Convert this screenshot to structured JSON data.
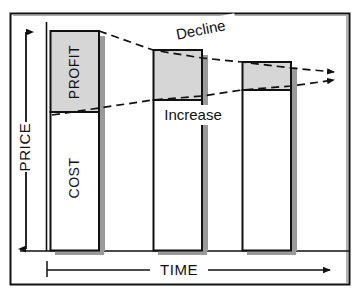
{
  "figure": {
    "type": "diagram",
    "axes": {
      "y_label": "PRICE",
      "x_label": "TIME",
      "y_arrow": "double-headed-vertical",
      "x_arrow": "single-right"
    },
    "segment_labels": {
      "profit": "PROFIT",
      "cost": "COST"
    },
    "trend_labels": {
      "decline": "Decline",
      "increase": "Increase"
    },
    "colors": {
      "profit_fill": "#d6d6d6",
      "cost_fill": "#ffffff",
      "outline": "#111111",
      "shadow": "#9a9a9a",
      "frame": "#111111",
      "background": "#ffffff"
    },
    "bars": [
      {
        "name": "bar-1",
        "x": 50,
        "width": 49,
        "top": 31,
        "baseline": 250,
        "profit_bottom": 112,
        "profit_label": "PROFIT",
        "cost_label": "COST"
      },
      {
        "name": "bar-2",
        "x": 153,
        "width": 49,
        "top": 50,
        "baseline": 250,
        "profit_bottom": 100,
        "profit_label": "",
        "cost_label": ""
      },
      {
        "name": "bar-3",
        "x": 242,
        "width": 49,
        "top": 62,
        "baseline": 250,
        "profit_bottom": 90,
        "profit_label": "",
        "cost_label": ""
      }
    ],
    "trend_lines": [
      {
        "name": "decline-line",
        "points": "98,31 153,50 202,58 242,62 291,68 338,72",
        "style": "dashed",
        "arrowhead": "end"
      },
      {
        "name": "increase-line",
        "points": "99,112 153,100 202,96 242,90 291,86 338,80",
        "style": "dashed",
        "arrowhead": "end"
      }
    ]
  }
}
